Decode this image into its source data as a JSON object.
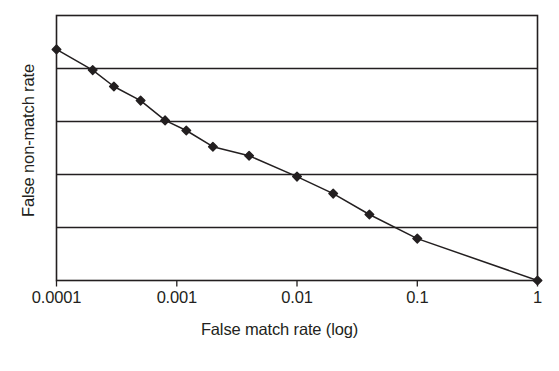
{
  "chart_data": {
    "type": "line",
    "title": "",
    "subtitle": "",
    "xlabel": "False match rate (log)",
    "ylabel": "False non-match rate",
    "xscale": "log",
    "xlim": [
      0.0001,
      1
    ],
    "ylim": [
      0,
      1
    ],
    "xtick_labels": [
      "0.0001",
      "0.001",
      "0.01",
      "0.1",
      "1"
    ],
    "xticks": [
      0.0001,
      0.001,
      0.01,
      0.1,
      1
    ],
    "ytick_labels": [],
    "grid": "horizontal",
    "gridline_count": 4,
    "legend": null,
    "legend_position": "none",
    "marker": "diamond",
    "line_color": "#231f20",
    "marker_color": "#231f20",
    "series": [
      {
        "name": "DET curve",
        "x": [
          0.0001,
          0.0002,
          0.0003,
          0.0005,
          0.0008,
          0.0012,
          0.002,
          0.004,
          0.01,
          0.02,
          0.04,
          0.1,
          1
        ],
        "y": [
          0.872,
          0.794,
          0.732,
          0.679,
          0.604,
          0.566,
          0.505,
          0.471,
          0.392,
          0.328,
          0.249,
          0.158,
          0.0
        ]
      }
    ],
    "annotations": []
  }
}
